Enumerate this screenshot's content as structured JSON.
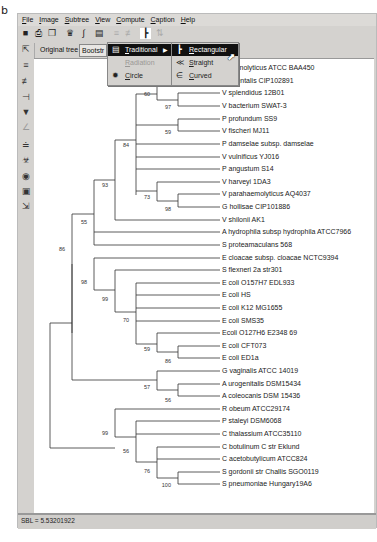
{
  "figure_label": "b",
  "menubar": [
    "File",
    "Image",
    "Subtree",
    "View",
    "Compute",
    "Caption",
    "Help"
  ],
  "toolbar": {
    "icons": [
      "save-icon",
      "print-icon",
      "copy-icon",
      "find-taxa-icon",
      "wrench-icon",
      "tree-layout-icon",
      "collapse-icon",
      "scale-icon",
      "rectangular-icon",
      "swap-icon"
    ]
  },
  "tabs": {
    "original": "Original tree",
    "bootstrap": "Bootstr"
  },
  "menu_layout": {
    "items": [
      {
        "label": "Traditional",
        "selected": true,
        "has_submenu": true
      },
      {
        "label": "Radiation",
        "disabled": true
      },
      {
        "label": "Circle"
      }
    ]
  },
  "submenu_traditional": {
    "items": [
      {
        "label": "Rectangular",
        "selected": true
      },
      {
        "label": "Straight"
      },
      {
        "label": "Curved"
      }
    ]
  },
  "left_tools": [
    "pointer-icon",
    "taxa-swap-icon",
    "flip-icon",
    "compress-icon",
    "root-icon",
    "rotate-icon",
    "subtree-icon",
    "mark-icon",
    "binoculars-icon",
    "zoom-icon",
    "resize-icon"
  ],
  "tree": {
    "leaves": [
      "V alginolyticus ATCC BAA450",
      "V orientalis CIP102891",
      "V splendidus 12B01",
      "V bacterium SWAT-3",
      "P profundum SS9",
      "V fischeri MJ11",
      "P damselae subsp. damselae",
      "V vulnificus YJ016",
      "P angustum S14",
      "V harveyi 1DA3",
      "V parahaemolyticus AQ4037",
      "G hollisae CIP101886",
      "V shilonii AK1",
      "A hydrophila subsp hydrophila ATCC7966",
      "S proteamaculans 568",
      "E cloacae subsp. cloacae NCTC9394",
      "S flexneri 2a str301",
      "E coli O157H7 EDL933",
      "E coli HS",
      "E coli K12 MG1655",
      "E coli SMS35",
      "Ecoli O127H6 E2348 69",
      "E coli CFT073",
      "E coli ED1a",
      "G vaginalis ATCC 14019",
      "A urogenitalis DSM15434",
      "A coleocanis DSM 15436",
      "R obeum ATCC29174",
      "P staleyi DSM6068",
      "C thalassium ATCC35110",
      "C botulinum C str Eklund",
      "C acetobutylicum ATCC824",
      "S gordonii str Challis SGO0119",
      "S pneumoniae Hungary19A6"
    ],
    "bootstrap": [
      {
        "value": "60",
        "x": 126,
        "y": 95
      },
      {
        "value": "97",
        "x": 147,
        "y": 108
      },
      {
        "value": "59",
        "x": 147,
        "y": 133
      },
      {
        "value": "84",
        "x": 105,
        "y": 146
      },
      {
        "value": "73",
        "x": 126,
        "y": 197
      },
      {
        "value": "98",
        "x": 147,
        "y": 210
      },
      {
        "value": "93",
        "x": 84,
        "y": 185
      },
      {
        "value": "55",
        "x": 63,
        "y": 222
      },
      {
        "value": "86",
        "x": 42,
        "y": 250
      },
      {
        "value": "98",
        "x": 63,
        "y": 282
      },
      {
        "value": "99",
        "x": 84,
        "y": 298
      },
      {
        "value": "70",
        "x": 105,
        "y": 320
      },
      {
        "value": "59",
        "x": 126,
        "y": 348
      },
      {
        "value": "86",
        "x": 147,
        "y": 360
      },
      {
        "value": "57",
        "x": 126,
        "y": 388
      },
      {
        "value": "56",
        "x": 147,
        "y": 400
      },
      {
        "value": "99",
        "x": 84,
        "y": 432
      },
      {
        "value": "56",
        "x": 105,
        "y": 450
      },
      {
        "value": "76",
        "x": 126,
        "y": 470
      },
      {
        "value": "100",
        "x": 147,
        "y": 486
      }
    ]
  },
  "status": {
    "text": "SBL = 5.53201922"
  }
}
